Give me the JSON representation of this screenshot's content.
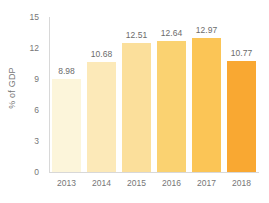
{
  "chart_data": {
    "type": "bar",
    "title": "",
    "subtitle": "",
    "xlabel": "",
    "ylabel": "% of GDP",
    "categories": [
      "2013",
      "2014",
      "2015",
      "2016",
      "2017",
      "2018"
    ],
    "values": [
      8.98,
      10.68,
      12.51,
      12.64,
      12.97,
      10.77
    ],
    "value_labels": [
      "8.98",
      "10.68",
      "12.51",
      "12.64",
      "12.97",
      "10.77"
    ],
    "ylim": [
      0,
      15
    ],
    "ytick_labels": [
      "15",
      "12",
      "9",
      "6",
      "3",
      "0"
    ],
    "ytick_values": [
      15,
      12,
      9,
      6,
      3,
      0
    ],
    "grid": false,
    "legend": "none",
    "bar_colors": [
      "#FCF5DA",
      "#FCE9B8",
      "#FBDF9B",
      "#FAD271",
      "#FBC556",
      "#F9A832"
    ],
    "axis_color": "#d8d8d8",
    "label_color": "#767676",
    "value_label_color": "#6b6b6b",
    "background": "#ffffff"
  }
}
